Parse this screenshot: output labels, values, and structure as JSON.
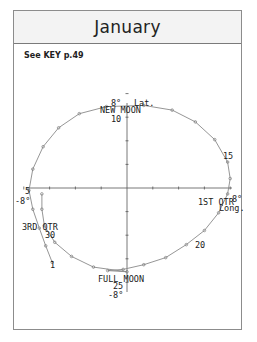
{
  "header": {
    "title": "January"
  },
  "key_note": "See KEY p.49",
  "colors": {
    "curve": "#8a8a8a",
    "axis": "#555555",
    "marker": "#7a7a7a",
    "text": "#1a1a1a",
    "header_bg": "#f3f3f3",
    "frame": "#8c8c8c"
  },
  "chart_data": {
    "type": "line",
    "title": "January",
    "subtitle": "See KEY p.49",
    "xlabel": "Long.",
    "ylabel": "Lat.",
    "xlim": [
      -8,
      8
    ],
    "ylim": [
      -8,
      8
    ],
    "x_tick_labels": [
      "-8°",
      "8°"
    ],
    "y_tick_labels": [
      "8°",
      "-8°"
    ],
    "grid": false,
    "legend": null,
    "series": [
      {
        "name": "Moon path (day of month)",
        "days": [
          1,
          2,
          3,
          4,
          5,
          6,
          7,
          8,
          9,
          10,
          11,
          12,
          13,
          14,
          15,
          16,
          17,
          18,
          19,
          20,
          21,
          22,
          23,
          24,
          25,
          26,
          27,
          28,
          29,
          30,
          31
        ],
        "x": [
          -5.8,
          -6.3,
          -6.8,
          -7.3,
          -7.6,
          -7.3,
          -6.5,
          -5.3,
          -3.7,
          -1.6,
          1.3,
          3.5,
          5.3,
          6.8,
          7.8,
          8.0,
          7.8,
          7.1,
          6.0,
          4.6,
          3.0,
          1.3,
          -0.3,
          -1.5,
          0.0,
          -2.6,
          -4.3,
          -5.6,
          -6.4,
          -6.6,
          -6.6
        ],
        "y": [
          -6.3,
          -4.9,
          -3.4,
          -1.8,
          -0.2,
          1.6,
          3.5,
          5.1,
          6.3,
          6.9,
          7.0,
          6.6,
          5.6,
          4.1,
          2.2,
          0.8,
          -0.5,
          -2.1,
          -3.6,
          -4.8,
          -5.9,
          -6.5,
          -6.9,
          -7.0,
          -7.1,
          -6.7,
          -5.8,
          -4.6,
          -3.2,
          -1.8,
          -0.5
        ]
      }
    ],
    "annotations": [
      {
        "text": "NEW MOON",
        "day": 10
      },
      {
        "text": "1ST QTR",
        "day": 16
      },
      {
        "text": "FULL MOON",
        "day": 25
      },
      {
        "text": "3RD QTR",
        "day": 30
      },
      {
        "text": "1",
        "day": 1
      },
      {
        "text": "5",
        "day": 5
      },
      {
        "text": "10",
        "day": 10
      },
      {
        "text": "15",
        "day": 15
      },
      {
        "text": "20",
        "day": 20
      },
      {
        "text": "25",
        "day": 25
      },
      {
        "text": "30",
        "day": 30
      }
    ]
  },
  "labels": {
    "lat": "Lat.",
    "long": "Long.",
    "y_top": "8°",
    "y_bottom": "-8°",
    "x_left": "-8°",
    "x_right": "8°",
    "new_moon": "NEW MOON",
    "first_qtr": "1ST QTR",
    "full_moon": "FULL MOON",
    "third_qtr": "3RD QTR",
    "d1": "1",
    "d5": "5",
    "d10": "10",
    "d15": "15",
    "d20": "20",
    "d25": "25",
    "d30": "30"
  }
}
